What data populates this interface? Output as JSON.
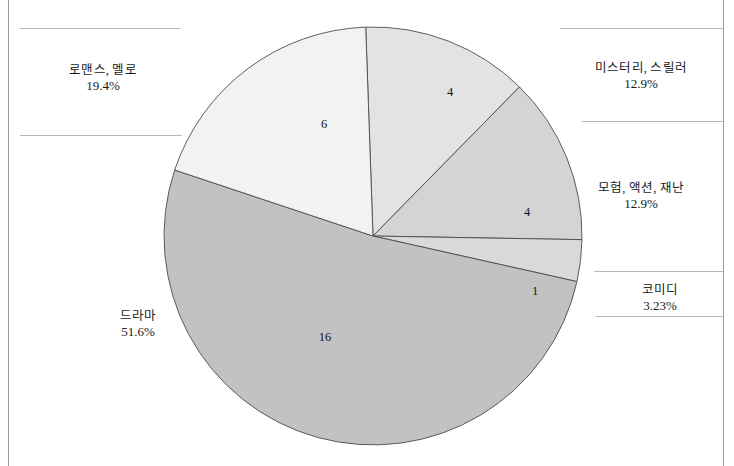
{
  "chart_data": {
    "type": "pie",
    "title": "",
    "subtitle": "",
    "xlabel": "",
    "ylabel": "",
    "legend_position": "none",
    "grid": false,
    "total": 31,
    "categories": [
      "미스터리, 스릴러",
      "모험, 액션, 재난",
      "코미디",
      "드라마",
      "로맨스, 멜로"
    ],
    "values": [
      4,
      4,
      1,
      16,
      6
    ],
    "percent_labels": [
      "12.9%",
      "12.9%",
      "3.23%",
      "51.6%",
      "19.4%"
    ],
    "value_labels": [
      "4",
      "4",
      "1",
      "16",
      "6"
    ],
    "slice_colors": [
      "#e3e3e3",
      "#d4d4d4",
      "#d9d9d9",
      "#c2c2c2",
      "#f2f2f2"
    ],
    "slices": [
      {
        "name": "미스터리, 스릴러",
        "value": 4,
        "value_label": "4",
        "percent": "12.9%",
        "color": "#e3e3e3",
        "start_angle": -2,
        "sweep": 46.5
      },
      {
        "name": "모험, 액션, 재난",
        "value": 4,
        "value_label": "4",
        "percent": "12.9%",
        "color": "#d4d4d4",
        "start_angle": 44.5,
        "sweep": 46.5
      },
      {
        "name": "코미디",
        "value": 1,
        "value_label": "1",
        "percent": "3.23%",
        "color": "#d9d9d9",
        "start_angle": 91,
        "sweep": 11.6
      },
      {
        "name": "드라마",
        "value": 16,
        "value_label": "16",
        "percent": "51.6%",
        "color": "#c2c2c2",
        "start_angle": 102.6,
        "sweep": 185.8
      },
      {
        "name": "로맨스, 멜로",
        "value": 6,
        "value_label": "6",
        "percent": "19.4%",
        "color": "#f2f2f2",
        "start_angle": 288.4,
        "sweep": 69.6
      }
    ]
  },
  "labels": {
    "romance": {
      "category": "로맨스, 멜로",
      "percent": "19.4%"
    },
    "mystery": {
      "category": "미스터리, 스릴러",
      "percent": "12.9%"
    },
    "adventure": {
      "category": "모험, 액션, 재난",
      "percent": "12.9%"
    },
    "comedy": {
      "category": "코미디",
      "percent": "3.23%"
    },
    "drama": {
      "category": "드라마",
      "percent": "51.6%"
    }
  },
  "slice_values": {
    "romance": "6",
    "mystery": "4",
    "adventure": "4",
    "comedy": "1",
    "drama": "16"
  }
}
